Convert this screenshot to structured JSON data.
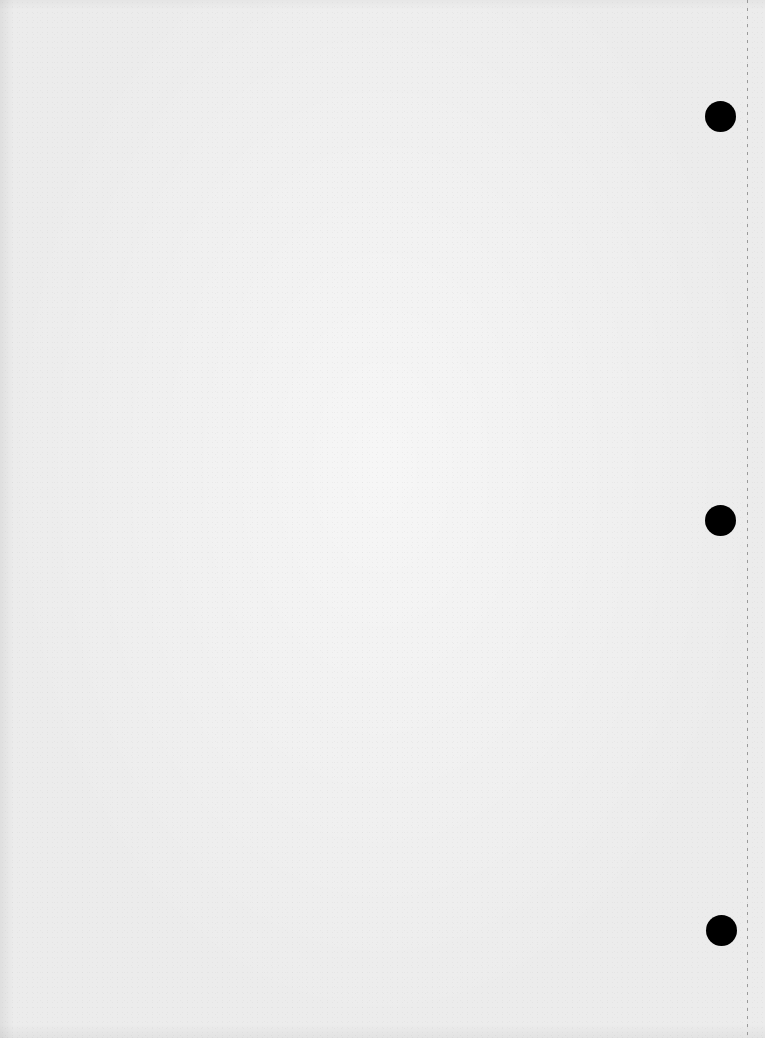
{
  "page": {
    "type": "blank loose-leaf paper",
    "background_color": "#ececec",
    "text": ""
  },
  "holes": [
    {
      "name": "top-hole",
      "cx": 720,
      "cy": 116,
      "r": 15,
      "color": "#000000"
    },
    {
      "name": "middle-hole",
      "cx": 720,
      "cy": 520,
      "r": 15,
      "color": "#000000"
    },
    {
      "name": "bottom-hole",
      "cx": 721,
      "cy": 930,
      "r": 15,
      "color": "#000000"
    }
  ],
  "perforation": {
    "x": 747,
    "style": "dashed",
    "color": "#9a9a9a"
  }
}
